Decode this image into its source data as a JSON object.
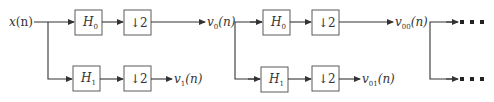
{
  "diagram": {
    "input": {
      "label": "x",
      "arg": "(n)"
    },
    "stage1": {
      "upper": {
        "filter": {
          "name": "H",
          "sub": "0"
        },
        "decimator": "↓2",
        "output": {
          "name": "v",
          "sub": "0",
          "arg": "(n)"
        }
      },
      "lower": {
        "filter": {
          "name": "H",
          "sub": "1"
        },
        "decimator": "↓2",
        "output": {
          "name": "v",
          "sub": "1",
          "arg": "(n)"
        }
      }
    },
    "stage2": {
      "upper": {
        "filter": {
          "name": "H",
          "sub": "0"
        },
        "decimator": "↓2",
        "output": {
          "name": "v",
          "sub": "00",
          "arg": "(n)"
        }
      },
      "lower": {
        "filter": {
          "name": "H",
          "sub": "1"
        },
        "decimator": "↓2",
        "output": {
          "name": "v",
          "sub": "01",
          "arg": "(n)"
        }
      }
    },
    "continuation": {
      "upper": "■ ■ ■",
      "lower": "■ ■ ■"
    }
  }
}
